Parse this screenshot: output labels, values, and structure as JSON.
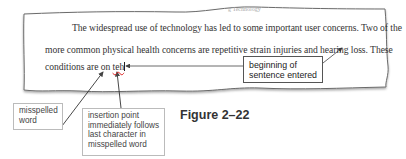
{
  "document": {
    "lines": [
      "The widespread use of technology has led to some important user concerns. Two of the",
      "more common physical health concerns are repetitive strain injuries and hearing loss. These",
      "conditions are on "
    ],
    "misspelled_word": "teh"
  },
  "callouts": {
    "beginning": "beginning of sentence entered",
    "misspelled": "misspelled word",
    "insertion": "insertion point immediately follows last character in misspelled word"
  },
  "figure": {
    "label": "Figure 2–22"
  },
  "colors": {
    "paper_edge": "#555555",
    "arrow": "#444444",
    "squiggle": "#dd2222"
  }
}
